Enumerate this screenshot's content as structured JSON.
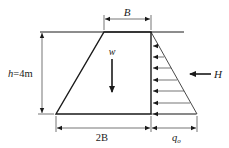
{
  "diagram": {
    "type": "gravity retaining wall / dam cross-section with triangular pressure",
    "labels": {
      "top_width": "B",
      "bottom_width": "2B",
      "height": "h=4m",
      "weight": "w",
      "horizontal_force": "H",
      "pressure_base": "q",
      "pressure_base_sub": "o"
    },
    "colors": {
      "line": "#1a1a1a",
      "background": "#ffffff"
    }
  }
}
